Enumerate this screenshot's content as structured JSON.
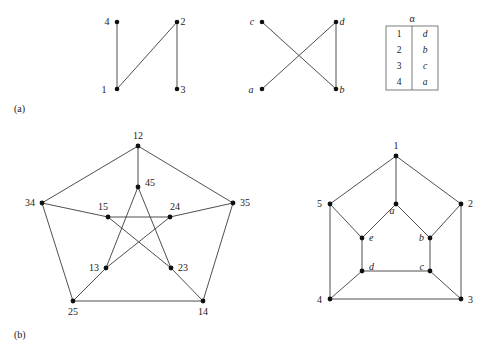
{
  "figure": {
    "panels": [
      {
        "id": "a",
        "label": "(a)"
      },
      {
        "id": "b",
        "label": "(b)"
      }
    ]
  },
  "graph_a_left": {
    "name": "graph-numbers-1234",
    "nodes": [
      {
        "id": "4",
        "label": "4",
        "x": 117,
        "y": 22,
        "lx": 107,
        "ly": 25,
        "style": "roman"
      },
      {
        "id": "2",
        "label": "2",
        "x": 177,
        "y": 22,
        "lx": 183,
        "ly": 25,
        "style": "roman"
      },
      {
        "id": "1",
        "label": "1",
        "x": 117,
        "y": 89,
        "lx": 104,
        "ly": 93,
        "style": "roman"
      },
      {
        "id": "3",
        "label": "3",
        "x": 177,
        "y": 89,
        "lx": 183,
        "ly": 93,
        "style": "roman"
      }
    ],
    "edges": [
      {
        "from": "4",
        "to": "1"
      },
      {
        "from": "1",
        "to": "2"
      },
      {
        "from": "2",
        "to": "3"
      }
    ]
  },
  "graph_a_right": {
    "name": "graph-letters-abcd",
    "nodes": [
      {
        "id": "c",
        "label": "c",
        "x": 262,
        "y": 22,
        "lx": 252,
        "ly": 25,
        "style": "italic"
      },
      {
        "id": "d",
        "label": "d",
        "x": 336,
        "y": 22,
        "lx": 342,
        "ly": 25,
        "style": "italic"
      },
      {
        "id": "a",
        "label": "a",
        "x": 262,
        "y": 89,
        "lx": 251,
        "ly": 93,
        "style": "italic"
      },
      {
        "id": "b",
        "label": "b",
        "x": 336,
        "y": 89,
        "lx": 342,
        "ly": 93,
        "style": "italic"
      }
    ],
    "edges": [
      {
        "from": "c",
        "to": "b"
      },
      {
        "from": "a",
        "to": "d"
      },
      {
        "from": "d",
        "to": "b"
      }
    ]
  },
  "alpha_table": {
    "name": "alpha-mapping-table",
    "header": "α",
    "rows": [
      {
        "from": "1",
        "to": "d"
      },
      {
        "from": "2",
        "to": "b"
      },
      {
        "from": "3",
        "to": "c"
      },
      {
        "from": "4",
        "to": "a"
      }
    ],
    "box": {
      "x": 386,
      "y": 26,
      "w": 52,
      "h": 64,
      "mid": 412
    }
  },
  "graph_b_left": {
    "name": "kneser-graph-pairs",
    "nodes": [
      {
        "id": "12",
        "label": "12",
        "x": 138,
        "y": 146,
        "lx": 138,
        "ly": 139,
        "anchor": "middle",
        "style": "roman"
      },
      {
        "id": "34",
        "label": "34",
        "x": 42,
        "y": 203,
        "lx": 35,
        "ly": 206,
        "anchor": "end",
        "style": "roman"
      },
      {
        "id": "35",
        "label": "35",
        "x": 233,
        "y": 203,
        "lx": 240,
        "ly": 206,
        "anchor": "start",
        "style": "roman"
      },
      {
        "id": "25",
        "label": "25",
        "x": 73,
        "y": 301,
        "lx": 73,
        "ly": 315,
        "anchor": "middle",
        "style": "roman"
      },
      {
        "id": "14",
        "label": "14",
        "x": 203,
        "y": 301,
        "lx": 203,
        "ly": 315,
        "anchor": "middle",
        "style": "roman"
      },
      {
        "id": "45",
        "label": "45",
        "x": 138,
        "y": 187,
        "lx": 145,
        "ly": 186,
        "anchor": "start",
        "style": "roman"
      },
      {
        "id": "15",
        "label": "15",
        "x": 108,
        "y": 217,
        "lx": 103,
        "ly": 210,
        "anchor": "middle",
        "style": "roman"
      },
      {
        "id": "24",
        "label": "24",
        "x": 170,
        "y": 217,
        "lx": 175,
        "ly": 210,
        "anchor": "middle",
        "style": "roman"
      },
      {
        "id": "13",
        "label": "13",
        "x": 106,
        "y": 268,
        "lx": 99,
        "ly": 271,
        "anchor": "end",
        "style": "roman"
      },
      {
        "id": "23",
        "label": "23",
        "x": 171,
        "y": 268,
        "lx": 178,
        "ly": 271,
        "anchor": "start",
        "style": "roman"
      }
    ],
    "edges": [
      {
        "from": "12",
        "to": "34"
      },
      {
        "from": "12",
        "to": "35"
      },
      {
        "from": "34",
        "to": "25"
      },
      {
        "from": "35",
        "to": "14"
      },
      {
        "from": "25",
        "to": "14"
      },
      {
        "from": "12",
        "to": "45"
      },
      {
        "from": "34",
        "to": "15"
      },
      {
        "from": "35",
        "to": "24"
      },
      {
        "from": "25",
        "to": "13"
      },
      {
        "from": "14",
        "to": "23"
      },
      {
        "from": "45",
        "to": "13"
      },
      {
        "from": "45",
        "to": "23"
      },
      {
        "from": "13",
        "to": "24"
      },
      {
        "from": "24",
        "to": "15"
      },
      {
        "from": "15",
        "to": "23"
      }
    ]
  },
  "graph_b_right": {
    "name": "petersen-graph-letters",
    "nodes": [
      {
        "id": "1",
        "label": "1",
        "x": 396,
        "y": 156,
        "lx": 396,
        "ly": 149,
        "anchor": "middle",
        "style": "roman"
      },
      {
        "id": "5",
        "label": "5",
        "x": 330,
        "y": 204,
        "lx": 322,
        "ly": 207,
        "anchor": "end",
        "style": "roman"
      },
      {
        "id": "2",
        "label": "2",
        "x": 461,
        "y": 204,
        "lx": 468,
        "ly": 207,
        "anchor": "start",
        "style": "roman"
      },
      {
        "id": "4",
        "label": "4",
        "x": 330,
        "y": 299,
        "lx": 322,
        "ly": 303,
        "anchor": "end",
        "style": "roman"
      },
      {
        "id": "3",
        "label": "3",
        "x": 461,
        "y": 299,
        "lx": 468,
        "ly": 303,
        "anchor": "start",
        "style": "roman"
      },
      {
        "id": "a",
        "label": "a",
        "x": 396,
        "y": 204,
        "lx": 392,
        "ly": 214,
        "anchor": "middle",
        "style": "italic"
      },
      {
        "id": "e",
        "label": "e",
        "x": 362,
        "y": 238,
        "lx": 369,
        "ly": 241,
        "anchor": "start",
        "style": "italic"
      },
      {
        "id": "b",
        "label": "b",
        "x": 430,
        "y": 238,
        "lx": 424,
        "ly": 241,
        "anchor": "end",
        "style": "italic"
      },
      {
        "id": "d",
        "label": "d",
        "x": 362,
        "y": 271,
        "lx": 369,
        "ly": 270,
        "anchor": "start",
        "style": "italic"
      },
      {
        "id": "c",
        "label": "c",
        "x": 430,
        "y": 271,
        "lx": 424,
        "ly": 270,
        "anchor": "end",
        "style": "italic"
      }
    ],
    "edges": [
      {
        "from": "1",
        "to": "5"
      },
      {
        "from": "1",
        "to": "2"
      },
      {
        "from": "5",
        "to": "4"
      },
      {
        "from": "2",
        "to": "3"
      },
      {
        "from": "4",
        "to": "3"
      },
      {
        "from": "1",
        "to": "a"
      },
      {
        "from": "5",
        "to": "e"
      },
      {
        "from": "2",
        "to": "b"
      },
      {
        "from": "4",
        "to": "d"
      },
      {
        "from": "3",
        "to": "c"
      },
      {
        "from": "a",
        "to": "e"
      },
      {
        "from": "a",
        "to": "b"
      },
      {
        "from": "e",
        "to": "d"
      },
      {
        "from": "b",
        "to": "c"
      },
      {
        "from": "d",
        "to": "c"
      }
    ]
  },
  "panel_labels": {
    "a": {
      "text": "(a)",
      "x": 14,
      "y": 112
    },
    "b": {
      "text": "(b)",
      "x": 14,
      "y": 338
    }
  }
}
